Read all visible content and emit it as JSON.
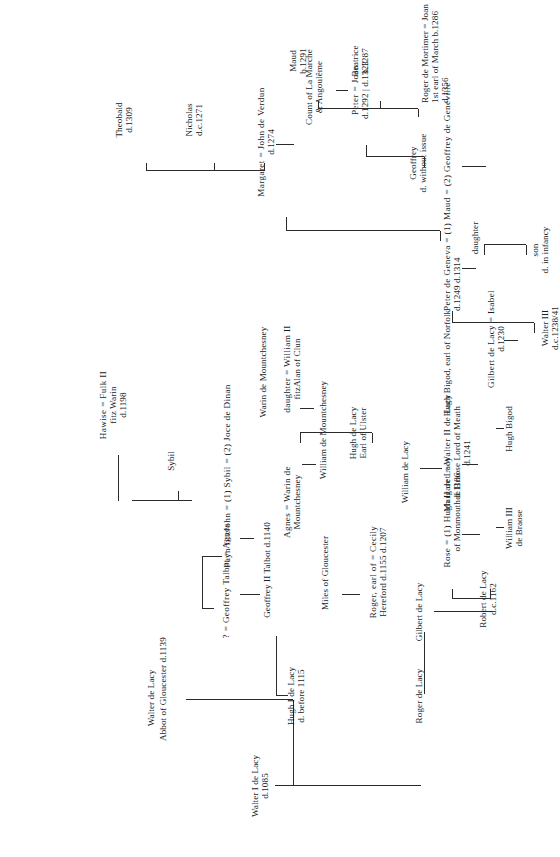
{
  "document": {
    "title": "Genealogical table of the de Lacy family",
    "orientation": "rotated-90-ccw",
    "ink_color": "#2b2b2b",
    "background_color": "#ffffff"
  },
  "people": {
    "walter_i": {
      "l1": "Walter I de Lacy",
      "l2": "d.1085"
    },
    "roger_de_lacy": {
      "l1": "Roger de Lacy"
    },
    "hugh_i": {
      "l1": "Hugh I de Lacy",
      "l2": "d. before 1115"
    },
    "walter_de_lacy_abbot": {
      "l1": "Walter de Lacy",
      "l2": "Abbot of Gloucester d.1139"
    },
    "geoffrey_talbot_agnes": {
      "l1": "? = Geoffrey Talbot = Agnes"
    },
    "geoffrey_ii_talbot": {
      "l1": "Geoffrey II Talbot d.1140"
    },
    "miles_of_gloucester": {
      "l1": "Miles of Gloucester"
    },
    "payn_fitzjohn_sybil": {
      "l1": "Payn fitzJohn = (1) Sybil = (2) Joce de Dinan"
    },
    "roger_cecily": {
      "l1": "Roger, earl of  = Cecily",
      "l2": "Hereford d.1155   d.1207"
    },
    "agnes_warin": {
      "l1": "Agnes = Warin de",
      "l2": "Mountchesney"
    },
    "sybil": {
      "l1": "Sybil"
    },
    "hawise_fulk": {
      "l1": "Hawise = Fulk II",
      "l2": "fitz Warin",
      "l3": "d.1198"
    },
    "william_de_mountchesney": {
      "l1": "William de Mountchesney"
    },
    "warin_de_mountchesney": {
      "l1": "Warin de Mountchesney"
    },
    "gilbert_de_lacy": {
      "l1": "Gilbert de Lacy"
    },
    "robert_de_lacy": {
      "l1": "Robert de Lacy",
      "l2": "d.c.1162"
    },
    "rose_hugh_ii": {
      "l1": "Rose = (1) Hugh II de Lacy",
      "l2": "of Monmouth      d.1186"
    },
    "william_iii_de_braose": {
      "l1": "William III",
      "l2": "de Braose"
    },
    "william_de_lacy": {
      "l1": "William de Lacy"
    },
    "margaret_walter_ii": {
      "l1": "Margaret = Walter II de Lacy",
      "l2": "de Braose   Lord of Meath",
      "l3": "d.1241"
    },
    "hugh_de_lacy_ulster": {
      "l1": "Hugh de Lacy",
      "l2": "Earl of Ulster"
    },
    "daughter_william_fitzalan": {
      "l1": "daughter = William II",
      "l2": "fitzAlan of Clun"
    },
    "hugh_bigod": {
      "l1": "Hugh Bigod"
    },
    "hugh_bigod_norfolk": {
      "l1": "Hugh Bigod, earl of Norfolk"
    },
    "gilbert_isabel": {
      "l1": "Gilbert de Lacy = Isabel",
      "l2": "d.1230"
    },
    "walter_iii": {
      "l1": "Walter III",
      "l2": "d.c.1238/41"
    },
    "peter_maud_geoffrey": {
      "l1": "Peter de Geneva = (1) Maud = (2) Geoffrey de Geneville",
      "l2": "d.1249                                          d.1314"
    },
    "son_infancy": {
      "l1": "son",
      "l2": "d. in infancy"
    },
    "daughter": {
      "l1": "daughter"
    },
    "margaret_john_verdun": {
      "l1": "Margaret = John de Verdun",
      "l2": "d.1274"
    },
    "nicholas": {
      "l1": "Nicholas",
      "l2": "d.c.1271"
    },
    "theobald": {
      "l1": "Theobald",
      "l2": "d.1309"
    },
    "geoffrey_no_issue": {
      "l1": "Geoffrey",
      "l2": "d. without issue"
    },
    "peter_joan": {
      "l1": "Peter = Joan",
      "l2": "d.1292 | d.1323"
    },
    "count_la_marche": {
      "l1": "Count of La Marche",
      "l2": "& Angoulême"
    },
    "roger_mortimer_joan": {
      "l1": "Roger de Mortimer = Joan",
      "l2": "1st earl of March      b.1286",
      "l3": "d.1356"
    },
    "beatrice": {
      "l1": "Beatrice",
      "l2": "b.1287"
    },
    "maud": {
      "l1": "Maud",
      "l2": "b.1291"
    }
  }
}
